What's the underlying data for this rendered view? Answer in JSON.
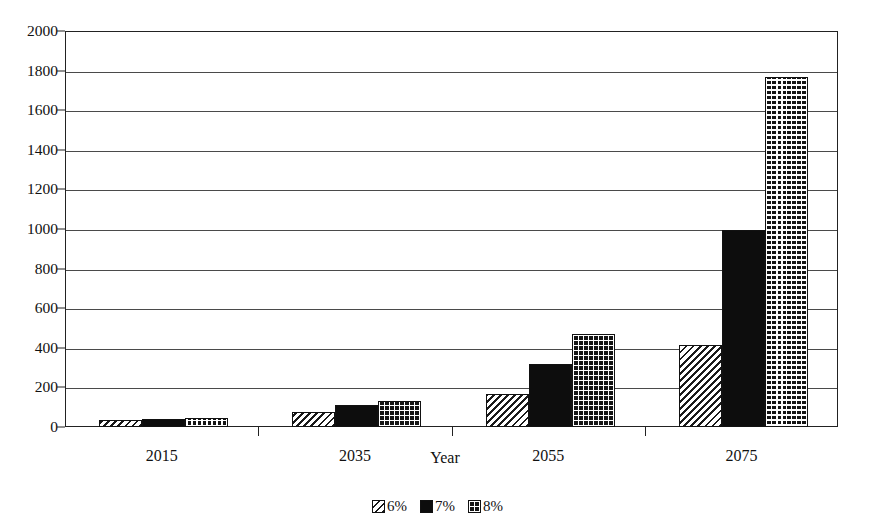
{
  "chart_data": {
    "type": "bar",
    "title": "",
    "xlabel": "Year",
    "ylabel": "",
    "categories": [
      "2015",
      "2035",
      "2055",
      "2075"
    ],
    "series": [
      {
        "name": "6%",
        "pattern": "diagonal-hatch",
        "color": "#ffffff",
        "values": [
          35,
          75,
          165,
          415
        ]
      },
      {
        "name": "7%",
        "pattern": "solid-black",
        "color": "#0d0d0d",
        "values": [
          40,
          110,
          320,
          995
        ]
      },
      {
        "name": "8%",
        "pattern": "cross-hatch",
        "color": "#141414",
        "values": [
          45,
          130,
          470,
          1770
        ]
      }
    ],
    "ylim": [
      0,
      2000
    ],
    "yticks": [
      0,
      200,
      400,
      600,
      800,
      1000,
      1200,
      1400,
      1600,
      1800,
      2000
    ],
    "ytick_labels": [
      "0",
      "200",
      "400",
      "600",
      "800",
      "1000",
      "1200",
      "1400",
      "1600",
      "1800",
      "2000"
    ],
    "grid": true,
    "grid_axis": "y",
    "legend_position": "bottom",
    "legend_entries": [
      "6%",
      "7%",
      "8%"
    ]
  }
}
